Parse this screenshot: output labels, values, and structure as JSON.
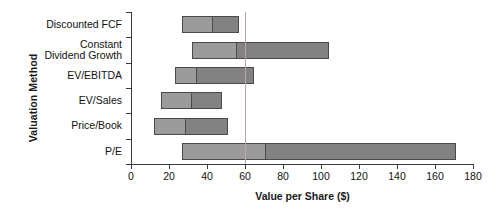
{
  "chart_data": {
    "type": "bar",
    "subtype": "football-field-range",
    "title": "",
    "xlabel": "Value per Share ($)",
    "ylabel": "Valuation Method",
    "xlim": [
      0,
      180
    ],
    "xticks": [
      0,
      20,
      40,
      60,
      80,
      100,
      120,
      140,
      160,
      180
    ],
    "grid": false,
    "legend": false,
    "reference_line": {
      "value": 60,
      "orientation": "vertical",
      "color": "#b8a9a0"
    },
    "colors": {
      "low_segment": "#9b9b9b",
      "high_segment": "#828282",
      "outline": "#4a4a4a",
      "axis": "#3a3a3a"
    },
    "categories": [
      "Discounted FCF",
      "Constant\nDividend Growth",
      "EV/EBITDA",
      "EV/Sales",
      "Price/Book",
      "P/E"
    ],
    "series": [
      {
        "name": "low",
        "values": [
          27,
          32,
          23,
          16,
          12,
          27
        ]
      },
      {
        "name": "midpoint",
        "values": [
          43,
          56,
          35,
          32,
          29,
          71
        ]
      },
      {
        "name": "high",
        "values": [
          57,
          104,
          65,
          48,
          51,
          171
        ]
      }
    ],
    "bars": [
      {
        "label": "Discounted FCF",
        "label_lines": [
          "Discounted FCF"
        ],
        "low": 27,
        "mid": 43,
        "high": 57
      },
      {
        "label": "Constant Dividend Growth",
        "label_lines": [
          "Constant",
          "Dividend Growth"
        ],
        "low": 32,
        "mid": 56,
        "high": 104
      },
      {
        "label": "EV/EBITDA",
        "label_lines": [
          "EV/EBITDA"
        ],
        "low": 23,
        "mid": 35,
        "high": 65
      },
      {
        "label": "EV/Sales",
        "label_lines": [
          "EV/Sales"
        ],
        "low": 16,
        "mid": 32,
        "high": 48
      },
      {
        "label": "Price/Book",
        "label_lines": [
          "Price/Book"
        ],
        "low": 12,
        "mid": 29,
        "high": 51
      },
      {
        "label": "P/E",
        "label_lines": [
          "P/E"
        ],
        "low": 27,
        "mid": 71,
        "high": 171
      }
    ]
  }
}
